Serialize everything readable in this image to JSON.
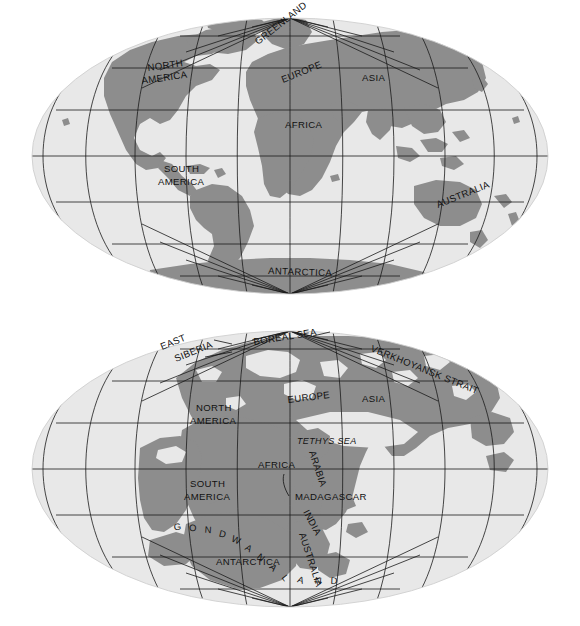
{
  "figure": {
    "title": "",
    "colors": {
      "background": "#ffffff",
      "ocean": "#e8e8e8",
      "land": "#8d8d8d",
      "graticule": "#1a1a1a",
      "label": "#111111"
    }
  },
  "maps": [
    {
      "id": "map-modern",
      "name": "present-day-world-map",
      "projection": "Mollweide",
      "graticule_interval_degrees": 30,
      "labels": [
        {
          "text": "GREENLAND",
          "name": "label-greenland",
          "x": 258,
          "y": 45,
          "rotate": -38,
          "style": "plain"
        },
        {
          "text": "NORTH",
          "name": "label-north-america",
          "x": 148,
          "y": 71,
          "rotate": -8,
          "style": "plain"
        },
        {
          "text": "AMERICA",
          "name": "label-north-america",
          "x": 142,
          "y": 84,
          "rotate": -8,
          "style": "plain"
        },
        {
          "text": "EUROPE",
          "name": "label-europe",
          "x": 283,
          "y": 83,
          "rotate": -22,
          "style": "plain"
        },
        {
          "text": "ASIA",
          "name": "label-asia",
          "x": 362,
          "y": 81,
          "rotate": 0,
          "style": "plain"
        },
        {
          "text": "AFRICA",
          "name": "label-africa",
          "x": 285,
          "y": 128,
          "rotate": 0,
          "style": "plain"
        },
        {
          "text": "SOUTH",
          "name": "label-south-america",
          "x": 164,
          "y": 172,
          "rotate": 0,
          "style": "plain"
        },
        {
          "text": "AMERICA",
          "name": "label-south-america",
          "x": 158,
          "y": 185,
          "rotate": 0,
          "style": "plain"
        },
        {
          "text": "AUSTRALIA",
          "name": "label-australia",
          "x": 438,
          "y": 208,
          "rotate": -22,
          "style": "plain"
        },
        {
          "text": "ANTARCTICA",
          "name": "label-antarctica",
          "x": 268,
          "y": 274,
          "rotate": 2,
          "style": "plain"
        }
      ]
    },
    {
      "id": "map-jurassic",
      "name": "jurassic-paleogeography-map",
      "projection": "Mollweide",
      "graticule_interval_degrees": 30,
      "labels": [
        {
          "text": "EAST",
          "name": "label-east-siberia",
          "x": 162,
          "y": 350,
          "rotate": -22,
          "style": "plain"
        },
        {
          "text": "SIBERIA",
          "name": "label-east-siberia",
          "x": 176,
          "y": 362,
          "rotate": -22,
          "style": "plain"
        },
        {
          "text": "BOREAL SEA",
          "name": "label-boreal-sea",
          "x": 254,
          "y": 345,
          "rotate": -9,
          "style": "plain"
        },
        {
          "text": "VERKHOYANSK STRAIT",
          "name": "label-verkhoyansk-strait",
          "x": 370,
          "y": 351,
          "rotate": 22,
          "style": "plain"
        },
        {
          "text": "NORTH",
          "name": "label-north-america",
          "x": 196,
          "y": 411,
          "rotate": 0,
          "style": "plain"
        },
        {
          "text": "AMERICA",
          "name": "label-north-america",
          "x": 190,
          "y": 424,
          "rotate": 0,
          "style": "plain"
        },
        {
          "text": "EUROPE",
          "name": "label-europe",
          "x": 288,
          "y": 403,
          "rotate": -7,
          "style": "plain"
        },
        {
          "text": "ASIA",
          "name": "label-asia",
          "x": 362,
          "y": 402,
          "rotate": 0,
          "style": "plain"
        },
        {
          "text": "TETHYS SEA",
          "name": "label-tethys-sea",
          "x": 297,
          "y": 444,
          "rotate": 0,
          "style": "italic"
        },
        {
          "text": "AFRICA",
          "name": "label-africa",
          "x": 258,
          "y": 468,
          "rotate": 0,
          "style": "plain"
        },
        {
          "text": "ARABIA",
          "name": "label-arabia",
          "x": 309,
          "y": 452,
          "rotate": 72,
          "style": "plain"
        },
        {
          "text": "SOUTH",
          "name": "label-south-america",
          "x": 190,
          "y": 487,
          "rotate": 0,
          "style": "plain"
        },
        {
          "text": "AMERICA",
          "name": "label-south-america",
          "x": 184,
          "y": 500,
          "rotate": 0,
          "style": "plain"
        },
        {
          "text": "MADAGASCAR",
          "name": "label-madagascar",
          "x": 295,
          "y": 500,
          "rotate": 0,
          "style": "plain"
        },
        {
          "text": "INDIA",
          "name": "label-india",
          "x": 303,
          "y": 512,
          "rotate": 62,
          "style": "plain"
        },
        {
          "text": "ANTARCTICA",
          "name": "label-antarctica",
          "x": 216,
          "y": 565,
          "rotate": 0,
          "style": "plain"
        },
        {
          "text": "AUSTRALIA",
          "name": "label-australia",
          "x": 299,
          "y": 534,
          "rotate": 72,
          "style": "plain"
        }
      ],
      "arc_label": {
        "text": "GONDWANALAND",
        "name": "label-gondwanaland",
        "letters": [
          "G",
          "O",
          "N",
          "D",
          "W",
          "A",
          "N",
          "A",
          "L",
          "A",
          "N",
          "D"
        ]
      },
      "leader_lines": [
        {
          "name": "leader-east-siberia"
        },
        {
          "name": "leader-boreal-sea"
        },
        {
          "name": "leader-madagascar"
        }
      ]
    }
  ]
}
